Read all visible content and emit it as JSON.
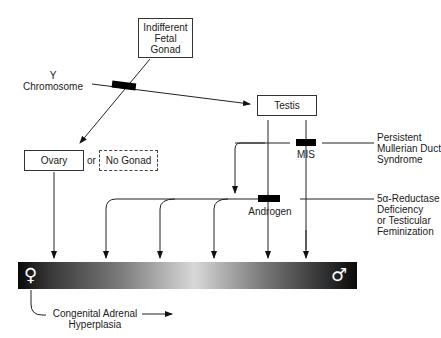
{
  "nodes": {
    "fetal_gonad": "Indifferent Fetal Gonad",
    "fetal_gonad_lines": [
      "Indifferent",
      "Fetal",
      "Gonad"
    ],
    "testis": "Testis",
    "ovary": "Ovary",
    "or": "or",
    "no_gonad": "No Gonad"
  },
  "labels": {
    "y_chromosome": [
      "Y",
      "Chromosome"
    ],
    "mis": "MIS",
    "androgen": "Androgen",
    "pmds": [
      "Persistent",
      "Mullerian Duct",
      "Syndrome"
    ],
    "reductase": [
      "5α-Reductase",
      "Deficiency",
      "or Testicular",
      "Feminization"
    ],
    "cah": [
      "Congenital Adrenal",
      "Hyperplasia"
    ]
  },
  "spectrum": {
    "female_symbol": "♀",
    "male_symbol": "♂",
    "colors": {
      "dark": "#0a0a0a",
      "light": "#d8d8d8"
    }
  }
}
